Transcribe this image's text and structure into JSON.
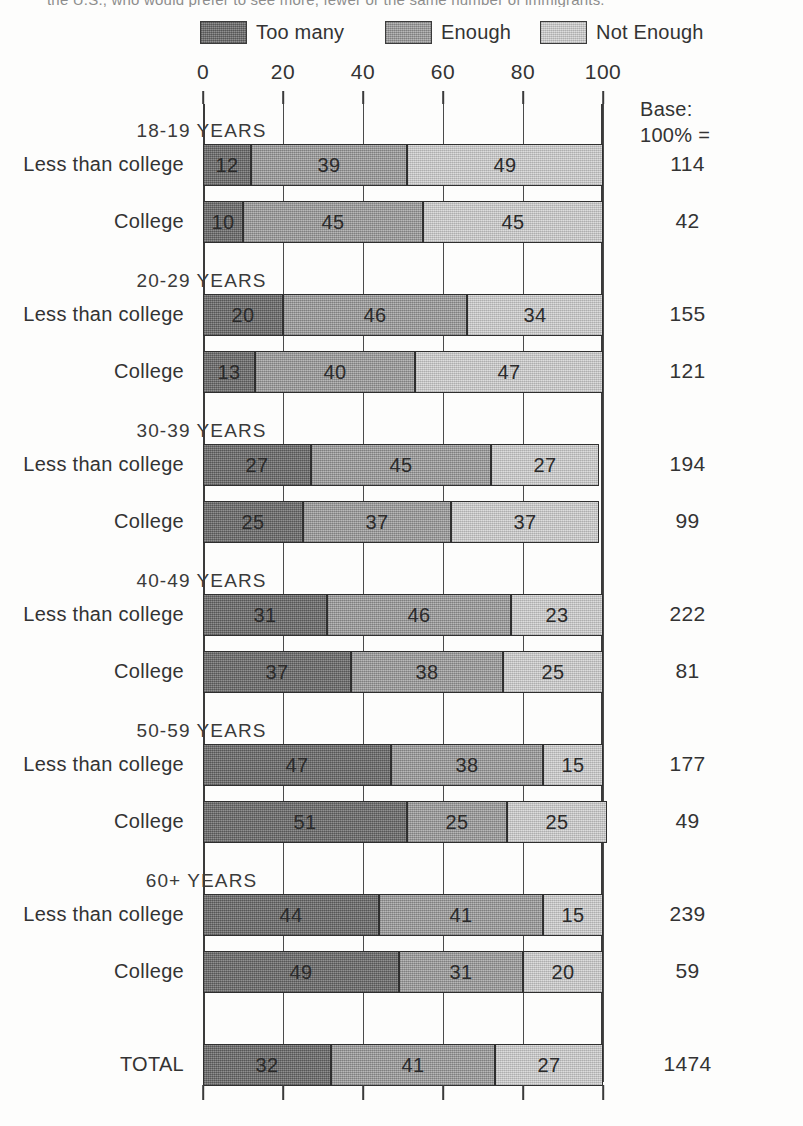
{
  "clipped_caption": "the U.S., who would prefer to see more, fewer or the same number of immigrants.",
  "legend": {
    "items": [
      {
        "label": "Too many",
        "color": "#787878",
        "key": "too_many"
      },
      {
        "label": "Enough",
        "color": "#a3a3a3",
        "key": "enough"
      },
      {
        "label": "Not Enough",
        "color": "#cdcdcd",
        "key": "not_enough"
      }
    ]
  },
  "base_header": {
    "line1": "Base:",
    "line2": "100% ="
  },
  "axis": {
    "ticks": [
      "0",
      "20",
      "40",
      "60",
      "80",
      "100"
    ]
  },
  "chart_data": {
    "type": "bar",
    "subtype": "100% stacked horizontal bar",
    "title": "",
    "xlabel": "",
    "ylabel": "",
    "xlim": [
      0,
      100
    ],
    "grid": true,
    "legend_position": "top",
    "series": [
      {
        "name": "Too many",
        "color": "#787878"
      },
      {
        "name": "Enough",
        "color": "#a3a3a3"
      },
      {
        "name": "Not Enough",
        "color": "#cdcdcd"
      }
    ],
    "groups": [
      {
        "title": "18-19 YEARS",
        "rows": [
          {
            "label": "Less than college",
            "values": [
              12,
              39,
              49
            ],
            "base": "114"
          },
          {
            "label": "College",
            "values": [
              10,
              45,
              45
            ],
            "base": "42"
          }
        ]
      },
      {
        "title": "20-29 YEARS",
        "rows": [
          {
            "label": "Less than college",
            "values": [
              20,
              46,
              34
            ],
            "base": "155"
          },
          {
            "label": "College",
            "values": [
              13,
              40,
              47
            ],
            "base": "121"
          }
        ]
      },
      {
        "title": "30-39 YEARS",
        "rows": [
          {
            "label": "Less than college",
            "values": [
              27,
              45,
              27
            ],
            "base": "194"
          },
          {
            "label": "College",
            "values": [
              25,
              37,
              37
            ],
            "base": "99"
          }
        ]
      },
      {
        "title": "40-49 YEARS",
        "rows": [
          {
            "label": "Less than college",
            "values": [
              31,
              46,
              23
            ],
            "base": "222"
          },
          {
            "label": "College",
            "values": [
              37,
              38,
              25
            ],
            "base": "81"
          }
        ]
      },
      {
        "title": "50-59 YEARS",
        "rows": [
          {
            "label": "Less than college",
            "values": [
              47,
              38,
              15
            ],
            "base": "177"
          },
          {
            "label": "College",
            "values": [
              51,
              25,
              25
            ],
            "base": "49"
          }
        ]
      },
      {
        "title": "60+  YEARS",
        "rows": [
          {
            "label": "Less than college",
            "values": [
              44,
              41,
              15
            ],
            "base": "239"
          },
          {
            "label": "College",
            "values": [
              49,
              31,
              20
            ],
            "base": "59"
          }
        ]
      }
    ],
    "total_row": {
      "label": "TOTAL",
      "values": [
        32,
        41,
        27
      ],
      "base": "1474"
    }
  }
}
